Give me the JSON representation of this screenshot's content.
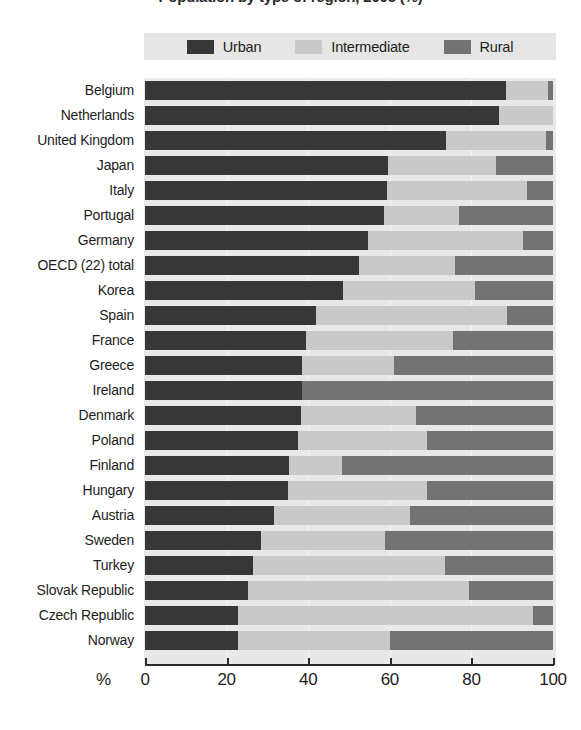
{
  "title": "Population by type of region, 2005 (%)",
  "legend": {
    "position": "top",
    "entries": [
      {
        "label": "Urban",
        "color": "#373737",
        "icon": "legend-swatch-urban"
      },
      {
        "label": "Intermediate",
        "color": "#c9c9c9",
        "icon": "legend-swatch-intermediate"
      },
      {
        "label": "Rural",
        "color": "#737373",
        "icon": "legend-swatch-rural"
      }
    ]
  },
  "axis": {
    "unit_label": "%",
    "ticks": [
      "0",
      "20",
      "40",
      "60",
      "80",
      "100"
    ],
    "min": 0,
    "max": 100
  },
  "colors": {
    "urban": "#373737",
    "intermediate": "#c9c9c9",
    "rural": "#737373",
    "plot_background": "#e8e8e8",
    "legend_background": "#e6e6e6",
    "axis": "#2a2a2a",
    "text": "#1d1d1d"
  },
  "chart_data": {
    "type": "bar",
    "orientation": "horizontal",
    "stacked": true,
    "title": "Population by type of region, 2005 (%)",
    "xlabel": "%",
    "ylabel": "",
    "xlim": [
      0,
      100
    ],
    "grid": true,
    "legend_position": "top",
    "categories": [
      "Belgium",
      "Netherlands",
      "United Kingdom",
      "Japan",
      "Italy",
      "Portugal",
      "Germany",
      "OECD (22) total",
      "Korea",
      "Spain",
      "France",
      "Greece",
      "Ireland",
      "Denmark",
      "Poland",
      "Finland",
      "Hungary",
      "Austria",
      "Sweden",
      "Turkey",
      "Slovak Republic",
      "Czech Republic",
      "Norway"
    ],
    "series": [
      {
        "name": "Urban",
        "color": "#373737",
        "values": [
          88.5,
          86.8,
          73.8,
          59.5,
          59.3,
          58.5,
          54.7,
          52.5,
          48.5,
          42.0,
          39.5,
          38.5,
          38.5,
          38.3,
          37.5,
          35.3,
          35.0,
          31.5,
          28.5,
          26.5,
          25.3,
          22.8,
          22.8
        ]
      },
      {
        "name": "Intermediate",
        "color": "#c9c9c9",
        "values": [
          10.3,
          13.2,
          24.5,
          26.5,
          34.3,
          18.5,
          38.0,
          23.5,
          32.5,
          46.7,
          36.0,
          22.5,
          0.0,
          28.2,
          31.5,
          13.0,
          34.0,
          33.5,
          30.3,
          47.0,
          54.0,
          72.3,
          37.2
        ]
      },
      {
        "name": "Rural",
        "color": "#737373",
        "values": [
          1.2,
          0.0,
          1.7,
          14.0,
          6.4,
          23.0,
          7.3,
          24.0,
          19.0,
          11.3,
          24.5,
          39.0,
          61.5,
          33.5,
          31.0,
          51.7,
          31.0,
          35.0,
          41.2,
          26.5,
          20.7,
          4.9,
          40.0
        ]
      }
    ]
  }
}
